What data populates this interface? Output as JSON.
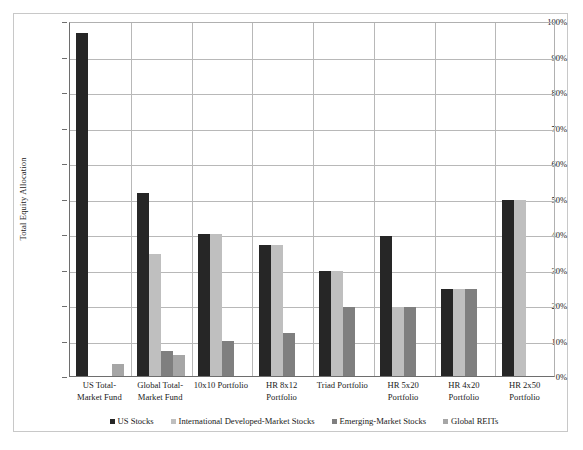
{
  "chart_data": {
    "type": "bar",
    "title": "",
    "xlabel": "",
    "ylabel": "Total Equity Allocation",
    "ylim": [
      0,
      100
    ],
    "ytick_labels": [
      "0%",
      "10%",
      "20%",
      "30%",
      "40%",
      "50%",
      "60%",
      "70%",
      "80%",
      "90%",
      "100%"
    ],
    "ytick_values": [
      0,
      10,
      20,
      30,
      40,
      50,
      60,
      70,
      80,
      90,
      100
    ],
    "grid": true,
    "legend_position": "bottom",
    "categories": [
      "US Total-\nMarket Fund",
      "Global Total-\nMarket Fund",
      "10x10 Portfolio",
      "HR 8x12\nPortfolio",
      "Triad Portfolio",
      "HR 5x20\nPortfolio",
      "HR 4x20\nPortfolio",
      "HR 2x50\nPortfolio"
    ],
    "series": [
      {
        "name": "US Stocks",
        "color": "#262626",
        "values": [
          96.5,
          51.5,
          40,
          37,
          29.5,
          39.5,
          24.5,
          49.5
        ]
      },
      {
        "name": "International Developed-Market Stocks",
        "color": "#bfbfbf",
        "values": [
          0,
          34.5,
          40,
          37,
          29.5,
          19.5,
          24.5,
          49.5
        ]
      },
      {
        "name": "Emerging-Market Stocks",
        "color": "#7f7f7f",
        "values": [
          0,
          7,
          9.8,
          12,
          19.5,
          19.5,
          24.5,
          0
        ]
      },
      {
        "name": "Global REITs",
        "color": "#a6a6a6",
        "values": [
          3.5,
          6,
          0,
          0,
          0,
          0,
          0,
          0
        ]
      }
    ]
  },
  "axis": {
    "y_title": "Total Equity Allocation"
  }
}
